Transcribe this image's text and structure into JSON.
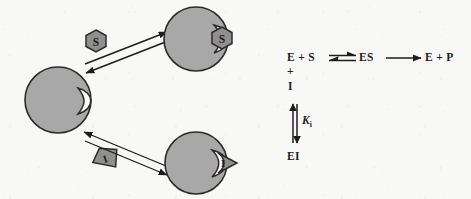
{
  "figure": {
    "type": "enzyme-inhibition-schematic",
    "background_color": "#f8f8f7",
    "ink_color": "#1d1d1d",
    "molecule_fill": "#a8a8a8",
    "molecule_stroke": "#2b2b2b",
    "active_site_color": "#fcfcfc"
  },
  "left_panel": {
    "name": "binding-schematic",
    "free_enzyme": {
      "label": "",
      "shape": "circle-with-notch",
      "cx": 58,
      "cy": 100,
      "r": 33
    },
    "free_substrate": {
      "label": "S",
      "shape": "hexagon",
      "cx": 96,
      "cy": 41,
      "r": 11
    },
    "free_inhibitor": {
      "label": "I",
      "shape": "wedge",
      "cx": 105,
      "cy": 158,
      "r": 12
    },
    "es_complex": {
      "enzyme_label": "",
      "ligand_label": "S",
      "ligand_shape": "hexagon",
      "cx": 196,
      "cy": 39,
      "r": 32
    },
    "ei_complex": {
      "enzyme_label": "",
      "ligand_label": "I",
      "ligand_shape": "wedge",
      "cx": 196,
      "cy": 163,
      "r": 31
    },
    "arrows": [
      {
        "name": "enzyme-to-es-forward",
        "direction": "up-right",
        "style": "reversible-pair"
      },
      {
        "name": "es-to-enzyme-reverse",
        "direction": "down-left",
        "style": "reversible-pair"
      },
      {
        "name": "enzyme-to-ei-forward",
        "direction": "down-right",
        "style": "reversible-pair"
      },
      {
        "name": "ei-to-enzyme-reverse",
        "direction": "up-left",
        "style": "reversible-pair"
      }
    ]
  },
  "equation": {
    "name": "enzyme-kinetics-equation",
    "top_row": {
      "enzyme_plus_substrate": "E + S",
      "equilibrium_arrow": "equilibrium-double-arrow",
      "es_complex": "ES",
      "forward_arrow": "forward-arrow",
      "products": "E + P"
    },
    "branch": {
      "plus_sign": "+",
      "inhibitor": "I",
      "vertical_arrow": "vertical-double-arrow",
      "constant_symbol": "K",
      "constant_subscript": "i",
      "ei_complex": "EI"
    }
  }
}
